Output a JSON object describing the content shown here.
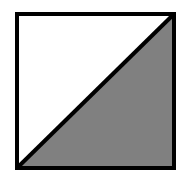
{
  "diagram": {
    "shape": "square-split-by-diagonal",
    "square": {
      "x": 17,
      "y": 14,
      "width": 157,
      "height": 154
    },
    "stroke_color": "#000000",
    "stroke_width": 4,
    "upper_left_region": {
      "fill": "#ffffff"
    },
    "lower_right_region": {
      "fill": "#808080"
    },
    "diagonal": {
      "from": "bottom-left",
      "to": "top-right"
    }
  }
}
